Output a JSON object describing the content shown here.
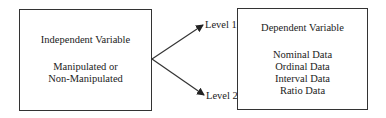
{
  "independent_variable": {
    "title": "Independent Variable",
    "lines": [
      "Manipulated or",
      "Non-Manipulated"
    ]
  },
  "levels": [
    {
      "label": "Level 1"
    },
    {
      "label": "Level 2"
    }
  ],
  "dependent_variable": {
    "title": "Dependent Variable",
    "data_types": [
      "Nominal Data",
      "Ordinal Data",
      "Interval Data",
      "Ratio Data"
    ]
  }
}
